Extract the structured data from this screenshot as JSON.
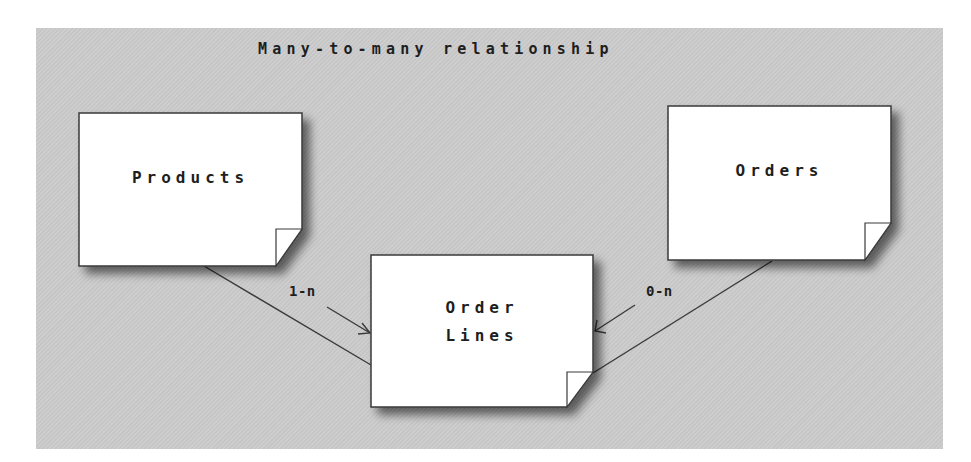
{
  "diagram": {
    "title": "Many-to-many relationship",
    "colors": {
      "background": "#ffffff",
      "panel": "#c9c9c9",
      "card": "#ffffff",
      "stroke": "#3a3a3a",
      "text": "#1e1e1e"
    },
    "nodes": [
      {
        "id": "products",
        "label": "Products",
        "shape": "dog-eared-note"
      },
      {
        "id": "orders",
        "label": "Orders",
        "shape": "dog-eared-note"
      },
      {
        "id": "order_lines",
        "label_line1": "Order",
        "label_line2": "Lines",
        "shape": "dog-eared-note"
      }
    ],
    "edges": [
      {
        "from": "products",
        "to": "order_lines",
        "multiplicity": "1-n"
      },
      {
        "from": "orders",
        "to": "order_lines",
        "multiplicity": "0-n"
      }
    ]
  }
}
